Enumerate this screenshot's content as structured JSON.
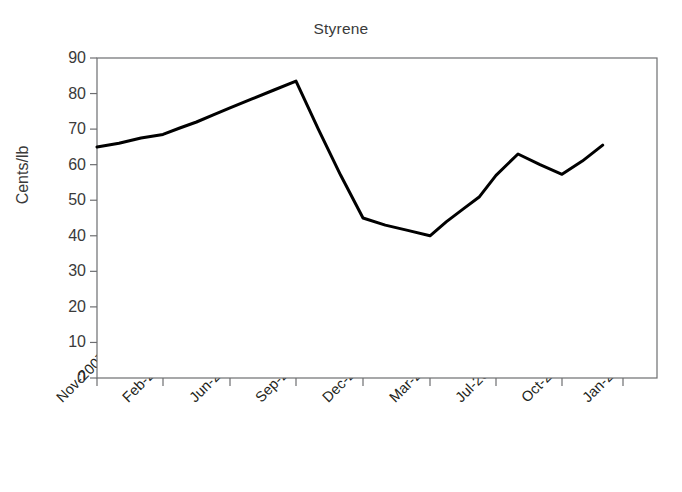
{
  "chart_data": {
    "type": "line",
    "title": "Styrene",
    "xlabel": "",
    "ylabel": "Cents/lb",
    "ylim": [
      0,
      90
    ],
    "ytick_labels": [
      "90",
      "80",
      "70",
      "60",
      "50",
      "40",
      "30",
      "20",
      "10",
      "0"
    ],
    "ytick_values": [
      90,
      80,
      70,
      60,
      50,
      40,
      30,
      20,
      10,
      0
    ],
    "xtick_labels": [
      "Nov-2007",
      "Feb-2008",
      "Jun-2008",
      "Sep-2008",
      "Dec-2008",
      "Mar-2009",
      "Jul-2009",
      "Oct-2009",
      "Jan-2010"
    ],
    "grid": false,
    "legend": false,
    "line_color": "#000000",
    "series": [
      {
        "name": "Styrene",
        "x": [
          "Nov-2007",
          "Dec-2007",
          "Jan-2008",
          "Feb-2008",
          "Mar-2008",
          "Apr-2008",
          "May-2008",
          "Jun-2008",
          "Jul-2008",
          "Aug-2008",
          "Sep-2008",
          "Oct-2008",
          "Nov-2008",
          "Dec-2008",
          "Jan-2009",
          "Feb-2009",
          "Mar-2009",
          "Apr-2009",
          "May-2009",
          "Jun-2009",
          "Jul-2009",
          "Aug-2009",
          "Sep-2009",
          "Oct-2009",
          "Nov-2009",
          "Dec-2009"
        ],
        "values": [
          65,
          66,
          67.5,
          68.5,
          70.3,
          72,
          74,
          76,
          78.5,
          81,
          83.5,
          70,
          57,
          45,
          43,
          41.5,
          40,
          44,
          47.5,
          51,
          57,
          63,
          60,
          57.3,
          61,
          65.5
        ]
      }
    ]
  }
}
